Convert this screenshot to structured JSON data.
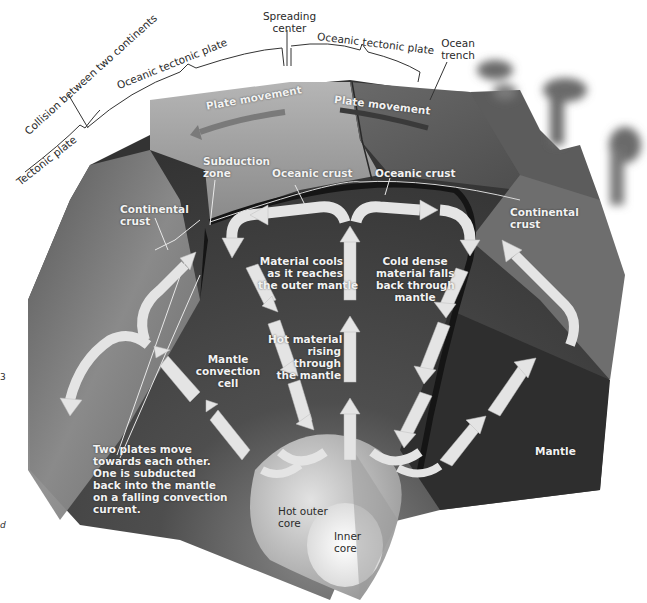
{
  "diagram": {
    "type": "labeled cross-section",
    "colors": {
      "background": "#ffffff",
      "surface_light": "#9a9a9a",
      "surface_dark": "#4a4a4a",
      "mantle": "#3c3c3c",
      "arrow": "#e6e6e6",
      "crust_band": "#1a1a1a",
      "outer_core": "#bdbdbd",
      "inner_core": "#f2f2f2",
      "label_dark": "#2a2a2a",
      "label_light": "#f2f2f2"
    }
  },
  "top_labels": {
    "tectonic_plate": "Tectonic plate",
    "collision": "Collision between two continents",
    "oceanic_plate_left": "Oceanic tectonic plate",
    "spreading_center": "Spreading\ncenter",
    "oceanic_plate_right": "Oceanic tectonic plate",
    "ocean_trench": "Ocean\ntrench"
  },
  "surface_labels": {
    "plate_movement_left": "Plate movement",
    "plate_movement_right": "Plate movement",
    "subduction_zone": "Subduction\nzone",
    "oceanic_crust_left": "Oceanic crust",
    "oceanic_crust_right": "Oceanic crust",
    "continental_crust_left": "Continental\ncrust",
    "continental_crust_right": "Continental\ncrust"
  },
  "interior_labels": {
    "material_cools": "Material cools\nas it reaches\nthe outer mantle",
    "cold_dense": "Cold dense\nmaterial falls\nback through\nmantle",
    "hot_material": "Hot material\nrising\nthrough\nthe mantle",
    "convection_cell": "Mantle\nconvection\ncell",
    "two_plates": "Two plates move\ntowards each other.\nOne is subducted\nback into the mantle\non a falling convection\ncurrent.",
    "mantle": "Mantle",
    "outer_core": "Hot outer\ncore",
    "inner_core": "Inner\ncore"
  },
  "margin_fragments": {
    "left_top": "3",
    "left_bottom": "d"
  }
}
